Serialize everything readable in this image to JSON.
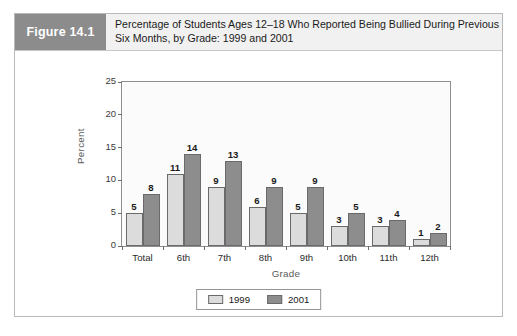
{
  "figure": {
    "badge_label": "Figure 14.1",
    "title_line1": "Percentage of Students Ages 12–18 Who Reported Being Bullied During Previous",
    "title_line2": "Six Months, by Grade: 1999 and 2001"
  },
  "colors": {
    "badge_background": "#8c8c8c",
    "header_background": "#f1f1f1",
    "series_1999": "#dcdcdc",
    "series_2001": "#8d8d8d",
    "bar_outline": "#6a6a6a",
    "plot_border": "#8f8f8f",
    "frame_border": "#b9b9b9"
  },
  "chart_data": {
    "type": "bar",
    "title": "Percentage of Students Ages 12–18 Who Reported Being Bullied During Previous Six Months, by Grade: 1999 and 2001",
    "xlabel": "Grade",
    "ylabel": "Percent",
    "categories": [
      "Total",
      "6th",
      "7th",
      "8th",
      "9th",
      "10th",
      "11th",
      "12th"
    ],
    "series": [
      {
        "name": "1999",
        "values": [
          5,
          11,
          9,
          6,
          5,
          3,
          3,
          1
        ]
      },
      {
        "name": "2001",
        "values": [
          8,
          14,
          13,
          9,
          9,
          5,
          4,
          2
        ]
      }
    ],
    "ylim": [
      0,
      25
    ],
    "yticks": [
      0,
      5,
      10,
      15,
      20,
      25
    ],
    "ytick_labels": [
      "0",
      "5",
      "10",
      "15",
      "20",
      "25"
    ],
    "grid": false,
    "legend_position": "bottom-center",
    "data_labels": true
  },
  "legend": {
    "items": [
      {
        "label": "1999"
      },
      {
        "label": "2001"
      }
    ]
  }
}
